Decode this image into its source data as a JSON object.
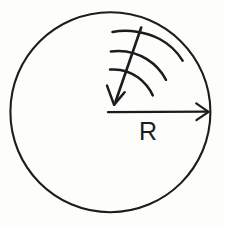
{
  "figure": {
    "kind": "physics-diagram",
    "background_color": "#fdfdfc",
    "ink_color": "#1c1c1c",
    "canvas": {
      "width": 225,
      "height": 228
    }
  },
  "circle": {
    "name": "boundary-circle",
    "center_x": 110,
    "center_y": 112,
    "radius": 100,
    "stroke_width": 2.1,
    "stroke_color": "#1c1c1c"
  },
  "radius_arrow": {
    "name": "radius-arrow",
    "start_x": 108,
    "start_y": 112,
    "end_x": 209,
    "end_y": 112,
    "stroke_width": 2.2,
    "arrowhead": "open-v"
  },
  "radius_label": {
    "text": "R",
    "x": 139,
    "y": 119,
    "font_size": 25,
    "color": "#1c1c1c"
  },
  "wave_arrow": {
    "name": "incident-wave-arrow",
    "start_x": 141,
    "start_y": 27,
    "end_x": 114,
    "end_y": 104,
    "stroke_width": 2.6,
    "arrowhead": "open-v",
    "direction": "down-left"
  },
  "wavefronts": {
    "name": "wavefront-arcs",
    "count": 3,
    "stroke_width": 2.5,
    "arcs": [
      {
        "index": 1,
        "label": "wavefront-outer"
      },
      {
        "index": 2,
        "label": "wavefront-middle"
      },
      {
        "index": 3,
        "label": "wavefront-inner"
      }
    ]
  }
}
